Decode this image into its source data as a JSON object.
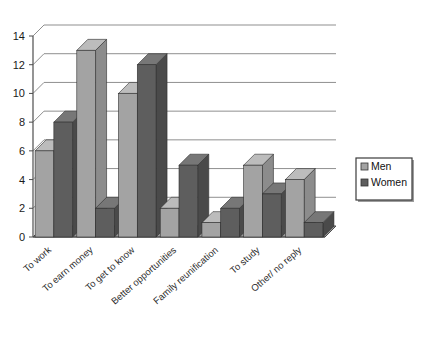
{
  "chart_data": {
    "type": "bar",
    "title": "",
    "subtitle": "",
    "xlabel": "",
    "ylabel": "",
    "ylim": [
      0,
      14
    ],
    "ytick_step": 2,
    "yticks": [
      "0",
      "2",
      "4",
      "6",
      "8",
      "10",
      "12",
      "14"
    ],
    "grid": true,
    "three_d": true,
    "legend_position": "right",
    "categories": [
      "To work",
      "To earn money",
      "To get to know",
      "Better opportunities",
      "Family reunification",
      "To study",
      "Other/ no reply"
    ],
    "series": [
      {
        "name": "Men",
        "color": "#a3a3a3",
        "values": [
          6,
          13,
          10,
          2,
          1,
          5,
          4
        ]
      },
      {
        "name": "Women",
        "color": "#5e5e5e",
        "values": [
          8,
          2,
          12,
          5,
          2,
          3,
          1
        ]
      }
    ]
  },
  "legend": {
    "entries": [
      {
        "label": "Men",
        "swatch": "#a3a3a3"
      },
      {
        "label": "Women",
        "swatch": "#5e5e5e"
      }
    ]
  },
  "colors": {
    "men_front": "#a3a3a3",
    "men_side": "#8c8c8c",
    "men_top": "#bcbcbc",
    "women_front": "#5e5e5e",
    "women_side": "#4a4a4a",
    "women_top": "#777777",
    "floor": "#9a9a9a",
    "gridline": "#8f8f8f",
    "axis": "#4d4d4d",
    "legend_border": "#3b3b3b",
    "background": "#ffffff"
  }
}
